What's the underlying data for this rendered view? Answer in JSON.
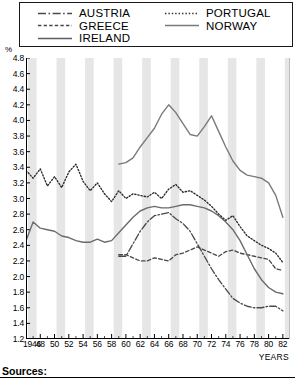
{
  "legend": {
    "entries": [
      {
        "label": "AUSTRIA",
        "style": "dash-dot",
        "color": "#4a4a4a",
        "column": "left"
      },
      {
        "label": "GREECE",
        "style": "dashed",
        "color": "#4a4a4a",
        "column": "left"
      },
      {
        "label": "IRELAND",
        "style": "solid",
        "color": "#6b6b6b",
        "column": "left"
      },
      {
        "label": "PORTUGAL",
        "style": "dotted",
        "color": "#2b2b2b",
        "column": "right"
      },
      {
        "label": "NORWAY",
        "style": "solid",
        "color": "#7a7a7a",
        "column": "right"
      }
    ]
  },
  "axes": {
    "unit": "%",
    "xtitle": "YEARS",
    "ylabels": [
      "4.8",
      "4.6",
      "4.4",
      "4.2",
      "4.0",
      "3.8",
      "3.6",
      "3.4",
      "3.2",
      "3.0",
      "2.8",
      "2.6",
      "2.4",
      "2.2",
      "2.0",
      "1.8",
      "1.6",
      "1.4",
      "1.2"
    ],
    "xlabels": [
      "1946",
      "48",
      "50",
      "52",
      "54",
      "56",
      "58",
      "60",
      "62",
      "64",
      "66",
      "68",
      "70",
      "72",
      "74",
      "76",
      "78",
      "80",
      "82"
    ]
  },
  "footer": {
    "sources": "Sources:"
  },
  "chart_data": {
    "type": "line",
    "title": "",
    "subtitle": "",
    "xlabel": "YEARS",
    "ylabel": "%",
    "ylim": [
      1.2,
      4.8
    ],
    "xlim": [
      1946,
      1983
    ],
    "ytick_step": 0.2,
    "xtick_step": 2,
    "grid": false,
    "band_shading": "alternating vertical grey bands every 2 years",
    "legend_position": "top, boxed, two columns",
    "series": [
      {
        "name": "AUSTRIA",
        "style": "dash-dot",
        "color": "#4a4a4a",
        "x": [
          1959,
          1960,
          1961,
          1962,
          1963,
          1964,
          1965,
          1966,
          1967,
          1968,
          1969,
          1970,
          1971,
          1972,
          1973,
          1974,
          1975,
          1976,
          1977,
          1978,
          1979,
          1980,
          1981,
          1982
        ],
        "values": [
          2.26,
          2.26,
          2.42,
          2.58,
          2.7,
          2.78,
          2.8,
          2.82,
          2.74,
          2.68,
          2.58,
          2.42,
          2.26,
          2.1,
          1.96,
          1.84,
          1.72,
          1.66,
          1.62,
          1.6,
          1.6,
          1.62,
          1.62,
          1.56
        ]
      },
      {
        "name": "GREECE",
        "style": "dashed",
        "color": "#4a4a4a",
        "x": [
          1959,
          1960,
          1961,
          1962,
          1963,
          1964,
          1965,
          1966,
          1967,
          1968,
          1969,
          1970,
          1971,
          1972,
          1973,
          1974,
          1975,
          1976,
          1977,
          1978,
          1979,
          1980,
          1981,
          1982
        ],
        "values": [
          2.28,
          2.28,
          2.24,
          2.2,
          2.2,
          2.24,
          2.22,
          2.2,
          2.28,
          2.3,
          2.34,
          2.38,
          2.34,
          2.3,
          2.26,
          2.32,
          2.34,
          2.3,
          2.28,
          2.26,
          2.24,
          2.22,
          2.1,
          2.08
        ]
      },
      {
        "name": "IRELAND",
        "style": "solid",
        "color": "#6b6b6b",
        "x": [
          1946,
          1947,
          1948,
          1949,
          1950,
          1951,
          1952,
          1953,
          1954,
          1955,
          1956,
          1957,
          1958,
          1959,
          1960,
          1961,
          1962,
          1963,
          1964,
          1965,
          1966,
          1967,
          1968,
          1969,
          1970,
          1971,
          1972,
          1973,
          1974,
          1975,
          1976,
          1977,
          1978,
          1979,
          1980,
          1981,
          1982
        ],
        "values": [
          2.46,
          2.7,
          2.62,
          2.6,
          2.58,
          2.52,
          2.5,
          2.46,
          2.44,
          2.44,
          2.48,
          2.44,
          2.46,
          2.56,
          2.66,
          2.76,
          2.84,
          2.88,
          2.9,
          2.88,
          2.88,
          2.9,
          2.92,
          2.92,
          2.9,
          2.88,
          2.84,
          2.78,
          2.7,
          2.6,
          2.46,
          2.28,
          2.1,
          1.96,
          1.86,
          1.8,
          1.78
        ]
      },
      {
        "name": "PORTUGAL",
        "style": "dotted",
        "color": "#2b2b2b",
        "x": [
          1946,
          1947,
          1948,
          1949,
          1950,
          1951,
          1952,
          1953,
          1954,
          1955,
          1956,
          1957,
          1958,
          1959,
          1960,
          1961,
          1962,
          1963,
          1964,
          1965,
          1966,
          1967,
          1968,
          1969,
          1970,
          1971,
          1972,
          1973,
          1974,
          1975,
          1976,
          1977,
          1978,
          1979,
          1980,
          1981,
          1982
        ],
        "values": [
          3.36,
          3.26,
          3.38,
          3.16,
          3.28,
          3.14,
          3.34,
          3.44,
          3.22,
          3.1,
          3.2,
          3.06,
          2.96,
          3.1,
          3.0,
          3.06,
          3.04,
          3.02,
          3.08,
          3.0,
          3.12,
          3.18,
          3.08,
          3.1,
          3.04,
          2.98,
          2.9,
          2.8,
          2.72,
          2.78,
          2.64,
          2.52,
          2.46,
          2.4,
          2.36,
          2.3,
          2.18
        ]
      },
      {
        "name": "NORWAY",
        "style": "solid",
        "color": "#7a7a7a",
        "x": [
          1959,
          1960,
          1961,
          1962,
          1963,
          1964,
          1965,
          1966,
          1967,
          1968,
          1969,
          1970,
          1971,
          1972,
          1973,
          1974,
          1975,
          1976,
          1977,
          1978,
          1979,
          1980,
          1981,
          1982
        ],
        "values": [
          3.44,
          3.46,
          3.52,
          3.66,
          3.78,
          3.9,
          4.08,
          4.2,
          4.1,
          3.96,
          3.82,
          3.8,
          3.92,
          4.06,
          3.86,
          3.66,
          3.48,
          3.36,
          3.3,
          3.28,
          3.26,
          3.2,
          3.04,
          2.76
        ]
      }
    ]
  }
}
